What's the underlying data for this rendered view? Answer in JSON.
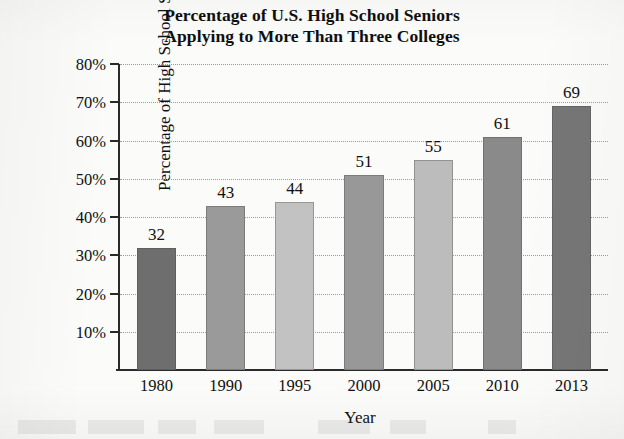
{
  "chart_data": {
    "type": "bar",
    "title": "Percentage of U.S. High School Seniors Applying to More Than Three Colleges",
    "title_lines": [
      "Percentage of U.S. High School Seniors",
      "Applying to More Than Three Colleges"
    ],
    "xlabel": "Year",
    "ylabel": "Percentage of High School Seniors",
    "categories": [
      "1980",
      "1990",
      "1995",
      "2000",
      "2005",
      "2010",
      "2013"
    ],
    "values": [
      32,
      43,
      44,
      51,
      55,
      61,
      69
    ],
    "value_labels": [
      "32",
      "43",
      "44",
      "51",
      "55",
      "61",
      "69"
    ],
    "ylim": [
      0,
      80
    ],
    "yticks": [
      10,
      20,
      30,
      40,
      50,
      60,
      70,
      80
    ],
    "ytick_labels": [
      "10%",
      "20%",
      "30%",
      "40%",
      "50%",
      "60%",
      "70%",
      "80%"
    ],
    "grid": "horizontal-dotted",
    "legend": "none",
    "bar_colors": [
      "#6e6e6e",
      "#9a9a9a",
      "#c2c2c2",
      "#989898",
      "#bcbcbc",
      "#8a8a8a",
      "#767676"
    ],
    "axis_color": "#2a2a2a",
    "gridline_color": "#9c9c9c",
    "background": "#fbfbfa"
  }
}
